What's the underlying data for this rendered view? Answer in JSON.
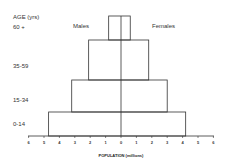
{
  "chart_data": {
    "type": "bar",
    "subtype": "population-pyramid",
    "title": "",
    "xlabel": "POPULATION (millions)",
    "ylabel": "AGE (yrs)",
    "categories": [
      "0-14",
      "15-34",
      "35-59",
      "60 +"
    ],
    "series": [
      {
        "name": "Males",
        "values": [
          4.7,
          3.2,
          2.1,
          0.8
        ]
      },
      {
        "name": "Females",
        "values": [
          4.2,
          3.0,
          1.8,
          0.6
        ]
      }
    ],
    "x_ticks": [
      "6",
      "5",
      "4",
      "3",
      "2",
      "1",
      "0",
      "1",
      "2",
      "3",
      "4",
      "5",
      "6"
    ],
    "xlim": [
      -6,
      6
    ],
    "grid": false,
    "legend": "inline labels: Males (left), Females (right)"
  },
  "labels": {
    "age_axis": "AGE (yrs)",
    "males": "Males",
    "females": "Females",
    "x_axis": "POPULATION (millions)"
  }
}
